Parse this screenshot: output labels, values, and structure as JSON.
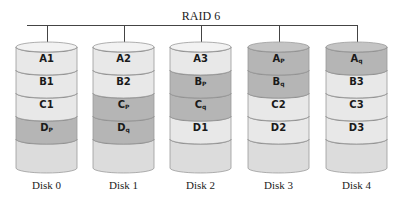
{
  "title": "RAID 6",
  "colors": {
    "data": "#e8e8e8",
    "parity": "#b5b5b5",
    "empty": "#dcdcdc",
    "edge": "#9a9a9a"
  },
  "disks": [
    {
      "label": "Disk 0",
      "blocks": [
        {
          "name": "A",
          "sub": "1",
          "kind": "data"
        },
        {
          "name": "B",
          "sub": "1",
          "kind": "data"
        },
        {
          "name": "C",
          "sub": "1",
          "kind": "data"
        },
        {
          "name": "D",
          "sub": "P",
          "kind": "parity"
        }
      ]
    },
    {
      "label": "Disk 1",
      "blocks": [
        {
          "name": "A",
          "sub": "2",
          "kind": "data"
        },
        {
          "name": "B",
          "sub": "2",
          "kind": "data"
        },
        {
          "name": "C",
          "sub": "P",
          "kind": "parity"
        },
        {
          "name": "D",
          "sub": "q",
          "kind": "parity"
        }
      ]
    },
    {
      "label": "Disk 2",
      "blocks": [
        {
          "name": "A",
          "sub": "3",
          "kind": "data"
        },
        {
          "name": "B",
          "sub": "P",
          "kind": "parity"
        },
        {
          "name": "C",
          "sub": "q",
          "kind": "parity"
        },
        {
          "name": "D",
          "sub": "1",
          "kind": "data"
        }
      ]
    },
    {
      "label": "Disk 3",
      "blocks": [
        {
          "name": "A",
          "sub": "P",
          "kind": "parity"
        },
        {
          "name": "B",
          "sub": "q",
          "kind": "parity"
        },
        {
          "name": "C",
          "sub": "2",
          "kind": "data"
        },
        {
          "name": "D",
          "sub": "2",
          "kind": "data"
        }
      ]
    },
    {
      "label": "Disk 4",
      "blocks": [
        {
          "name": "A",
          "sub": "q",
          "kind": "parity"
        },
        {
          "name": "B",
          "sub": "3",
          "kind": "data"
        },
        {
          "name": "C",
          "sub": "3",
          "kind": "data"
        },
        {
          "name": "D",
          "sub": "3",
          "kind": "data"
        }
      ]
    }
  ]
}
